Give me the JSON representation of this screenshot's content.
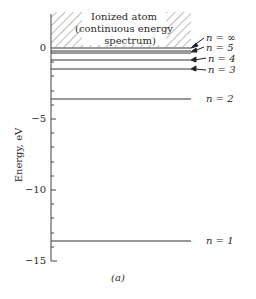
{
  "caption_top_fragment": "",
  "region": {
    "title_line1": "Ionized atom",
    "title_line2": "(continuous energy",
    "title_line3": "spectrum)"
  },
  "axis": {
    "ylabel": "Energy, eV",
    "ticks": [
      "0",
      "−5",
      "−10",
      "−15"
    ]
  },
  "levels": [
    {
      "label": "n = ∞",
      "energy": 0
    },
    {
      "label": "n = 5",
      "energy": -0.54
    },
    {
      "label": "n = 4",
      "energy": -0.85
    },
    {
      "label": "n = 3",
      "energy": -1.51
    },
    {
      "label": "n = 2",
      "energy": -3.4
    },
    {
      "label": "n = 1",
      "energy": -13.6
    }
  ],
  "figure_label": "(a)"
}
